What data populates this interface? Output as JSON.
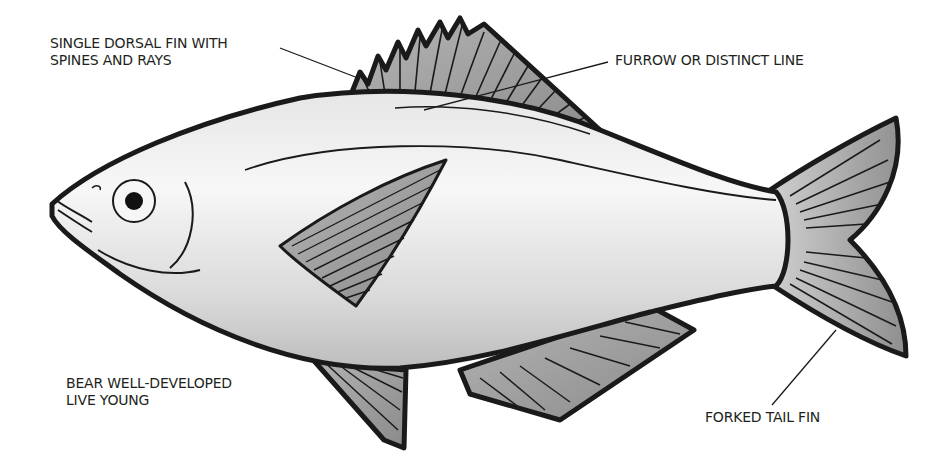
{
  "diagram": {
    "labels": {
      "dorsal_fin_line1": "SINGLE DORSAL FIN WITH",
      "dorsal_fin_line2": "SPINES AND RAYS",
      "furrow": "FURROW OR DISTINCT LINE",
      "live_young_line1": "BEAR WELL-DEVELOPED",
      "live_young_line2": "LIVE YOUNG",
      "tail": "FORKED TAIL FIN"
    },
    "colors": {
      "outline": "#1a1a1a",
      "body_light": "#f2f2f2",
      "body_shade": "#c9c9c9",
      "fin_fill": "#9d9d9d",
      "text": "#231f20"
    }
  }
}
